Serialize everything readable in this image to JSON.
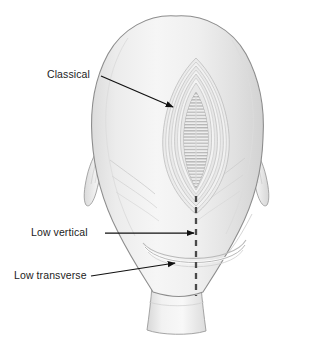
{
  "figure": {
    "background_color": "#ffffff"
  },
  "labels": [
    {
      "id": "classical",
      "text": "Classical",
      "x": 47,
      "y": 68,
      "leader": "diagonal-arrow"
    },
    {
      "id": "low_vertical",
      "text": "Low vertical",
      "x": 31,
      "y": 226,
      "leader": "horizontal-arrow"
    },
    {
      "id": "low_transverse",
      "text": "Low transverse",
      "x": 14,
      "y": 269,
      "leader": "diagonal-arrow"
    }
  ],
  "colors": {
    "outline": "#8d8d8d",
    "body_fill_light": "#f2f2f2",
    "body_fill_mid": "#e4e4e4",
    "body_fill_shadow": "#cfcfcf",
    "incision_hatch": "#b5b5b5",
    "label_text": "#1c1c1c",
    "leader_line": "#111111",
    "dashed_line": "#4a4a4a"
  },
  "anatomy": {
    "fundus": "dome-shaped uterine body",
    "cervix": "tapered cylindrical lower segment",
    "adnexa_left": "left round ligament / tube",
    "adnexa_right": "right round ligament / tube",
    "classical_incision": "open vertical midline lens-shaped wound with layered myometrial rings and horizontal hatching",
    "low_vertical_incision": "vertical dashed line on lower uterine segment",
    "low_transverse_incision": "curved transverse arc across lower uterine segment"
  }
}
